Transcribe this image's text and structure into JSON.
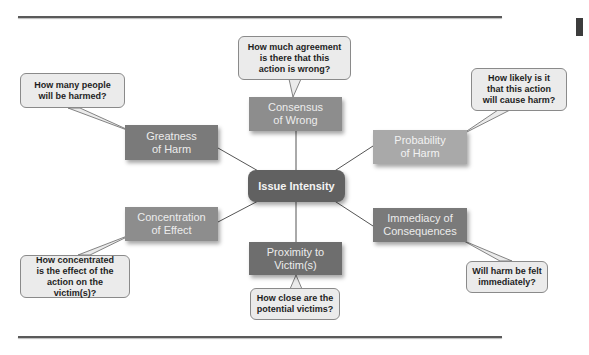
{
  "diagram": {
    "center": {
      "label": "Issue Intensity"
    },
    "nodes": [
      {
        "id": "consensus",
        "label": "Consensus of Wrong",
        "line1": "Consensus",
        "line2": "of Wrong",
        "callout_lines": [
          "How much agreement",
          "is there that this",
          "action is wrong?"
        ]
      },
      {
        "id": "greatness",
        "label": "Greatness of Harm",
        "line1": "Greatness",
        "line2": "of Harm",
        "callout_lines": [
          "How many people",
          "will be harmed?"
        ]
      },
      {
        "id": "probability",
        "label": "Probability of Harm",
        "line1": "Probability",
        "line2": "of Harm",
        "callout_lines": [
          "How likely is it",
          "that this action",
          "will cause harm?"
        ]
      },
      {
        "id": "concentration",
        "label": "Concentration of Effect",
        "line1": "Concentration",
        "line2": "of Effect",
        "callout_lines": [
          "How concentrated",
          "is the effect of the",
          "action on the victim(s)?"
        ]
      },
      {
        "id": "immediacy",
        "label": "Immediacy of Consequences",
        "line1": "Immediacy of",
        "line2": "Consequences",
        "callout_lines": [
          "Will harm be felt",
          "immediately?"
        ]
      },
      {
        "id": "proximity",
        "label": "Proximity to Victim(s)",
        "line1": "Proximity to",
        "line2": "Victim(s)",
        "callout_lines": [
          "How close are the",
          "potential victims?"
        ]
      }
    ]
  },
  "colors": {
    "center": "#616161",
    "node_dark": "#7a7a7a",
    "node_light": "#a9a9a9",
    "callout_bg": "#ebebeb",
    "rule": "#5a5a5a"
  }
}
